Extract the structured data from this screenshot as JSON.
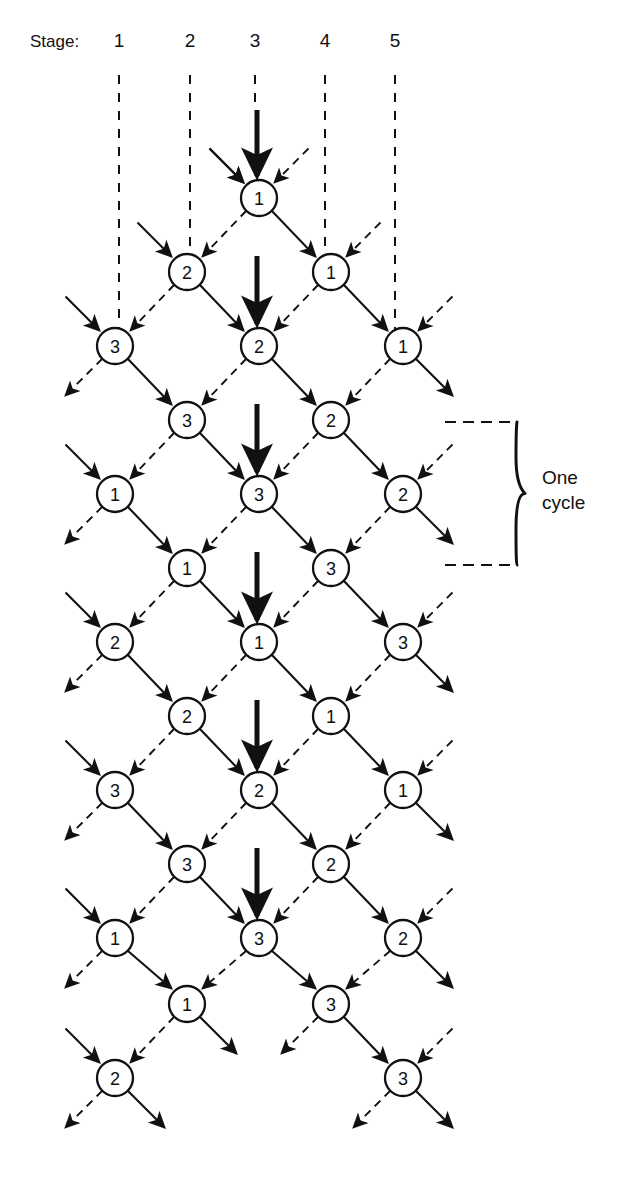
{
  "figure": {
    "type": "lattice-trellis-diagram",
    "background": "#ffffff",
    "ink": "#111111"
  },
  "stage_axis": {
    "label": "Stage:",
    "label_x": 30,
    "label_y": 47,
    "ticks": [
      {
        "text": "1",
        "x": 119,
        "y": 47,
        "line_x": 119,
        "line_top": 75,
        "line_bottom": 330
      },
      {
        "text": "2",
        "x": 190,
        "y": 47,
        "line_x": 190,
        "line_top": 75,
        "line_bottom": 258
      },
      {
        "text": "3",
        "x": 255,
        "y": 47,
        "line_x": 255,
        "line_top": 75,
        "line_bottom": 110
      },
      {
        "text": "4",
        "x": 325,
        "y": 47,
        "line_x": 325,
        "line_top": 75,
        "line_bottom": 258
      },
      {
        "text": "5",
        "x": 395,
        "y": 47,
        "line_x": 395,
        "line_top": 75,
        "line_bottom": 330
      }
    ]
  },
  "geometry": {
    "node_radius": 18,
    "col_step": 72,
    "row_step": 74,
    "col_x": [
      115,
      187,
      259,
      331,
      403
    ],
    "row_y": [
      198,
      272,
      346,
      420,
      494,
      568,
      642,
      716,
      790,
      864,
      938,
      1004,
      1078
    ]
  },
  "nodes": [
    {
      "label": "1",
      "col": 2,
      "row": 0,
      "x": 259,
      "y": 198
    },
    {
      "label": "2",
      "col": 1,
      "row": 1,
      "x": 187,
      "y": 272
    },
    {
      "label": "1",
      "col": 3,
      "row": 1,
      "x": 331,
      "y": 272
    },
    {
      "label": "3",
      "col": 0,
      "row": 2,
      "x": 115,
      "y": 346
    },
    {
      "label": "2",
      "col": 2,
      "row": 2,
      "x": 259,
      "y": 346
    },
    {
      "label": "1",
      "col": 4,
      "row": 2,
      "x": 403,
      "y": 346
    },
    {
      "label": "3",
      "col": 1,
      "row": 3,
      "x": 187,
      "y": 420
    },
    {
      "label": "2",
      "col": 3,
      "row": 3,
      "x": 331,
      "y": 420
    },
    {
      "label": "1",
      "col": 0,
      "row": 4,
      "x": 115,
      "y": 494
    },
    {
      "label": "3",
      "col": 2,
      "row": 4,
      "x": 259,
      "y": 494
    },
    {
      "label": "2",
      "col": 4,
      "row": 4,
      "x": 403,
      "y": 494
    },
    {
      "label": "1",
      "col": 1,
      "row": 5,
      "x": 187,
      "y": 568
    },
    {
      "label": "3",
      "col": 3,
      "row": 5,
      "x": 331,
      "y": 568
    },
    {
      "label": "2",
      "col": 0,
      "row": 6,
      "x": 115,
      "y": 642
    },
    {
      "label": "1",
      "col": 2,
      "row": 6,
      "x": 259,
      "y": 642
    },
    {
      "label": "3",
      "col": 4,
      "row": 6,
      "x": 403,
      "y": 642
    },
    {
      "label": "2",
      "col": 1,
      "row": 7,
      "x": 187,
      "y": 716
    },
    {
      "label": "1",
      "col": 3,
      "row": 7,
      "x": 331,
      "y": 716
    },
    {
      "label": "3",
      "col": 0,
      "row": 8,
      "x": 115,
      "y": 790
    },
    {
      "label": "2",
      "col": 2,
      "row": 8,
      "x": 259,
      "y": 790
    },
    {
      "label": "1",
      "col": 4,
      "row": 8,
      "x": 403,
      "y": 790
    },
    {
      "label": "3",
      "col": 1,
      "row": 9,
      "x": 187,
      "y": 864
    },
    {
      "label": "2",
      "col": 3,
      "row": 9,
      "x": 331,
      "y": 864
    },
    {
      "label": "1",
      "col": 0,
      "row": 10,
      "x": 115,
      "y": 938
    },
    {
      "label": "3",
      "col": 2,
      "row": 10,
      "x": 259,
      "y": 938
    },
    {
      "label": "2",
      "col": 4,
      "row": 10,
      "x": 403,
      "y": 938
    },
    {
      "label": "1",
      "col": 1,
      "row": 11,
      "x": 187,
      "y": 1004
    },
    {
      "label": "3",
      "col": 3,
      "row": 11,
      "x": 331,
      "y": 1004
    },
    {
      "label": "2",
      "col": 0,
      "row": 12,
      "x": 115,
      "y": 1078
    },
    {
      "label": "3",
      "col": 4,
      "row": 12,
      "x": 403,
      "y": 1078
    }
  ],
  "bold_input_arrows": [
    {
      "x": 257,
      "y_start": 110,
      "y_end": 176
    },
    {
      "x": 257,
      "y_start": 256,
      "y_end": 324
    },
    {
      "x": 257,
      "y_start": 404,
      "y_end": 472
    },
    {
      "x": 257,
      "y_start": 552,
      "y_end": 620
    },
    {
      "x": 257,
      "y_start": 700,
      "y_end": 768
    },
    {
      "x": 257,
      "y_start": 848,
      "y_end": 916
    }
  ],
  "edge_styles": {
    "down_right": "solid",
    "down_left": "dashed"
  },
  "cycle_bracket": {
    "label_line1": "One",
    "label_line2": "cycle",
    "top_y": 422,
    "bottom_y": 565,
    "dash_x_start": 445,
    "dash_x_end": 515,
    "brace_x": 517,
    "text_x": 542,
    "text_y1": 484,
    "text_y2": 509
  }
}
